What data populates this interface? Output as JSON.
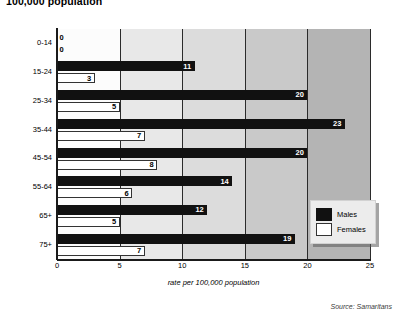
{
  "chart_data": {
    "type": "bar",
    "orientation": "horizontal",
    "title": "100,000 population",
    "xlabel": "rate per 100,000 population",
    "ylabel": "",
    "xlim": [
      0,
      25
    ],
    "xticks": [
      0,
      5,
      10,
      15,
      20,
      25
    ],
    "grid": true,
    "legend_position": "bottom-right",
    "categories": [
      "0-14",
      "15-24",
      "25-34",
      "35-44",
      "45-54",
      "55-64",
      "65+",
      "75+"
    ],
    "series": [
      {
        "name": "Males",
        "color": "#111111",
        "values": [
          0,
          11,
          20,
          23,
          20,
          14,
          12,
          19
        ]
      },
      {
        "name": "Females",
        "color": "#ffffff",
        "values": [
          0,
          3,
          5,
          7,
          8,
          6,
          5,
          7
        ]
      }
    ],
    "annotations": {
      "source": "Source: Samaritans"
    }
  },
  "legend": {
    "items": [
      {
        "label": "Males"
      },
      {
        "label": "Females"
      }
    ]
  }
}
